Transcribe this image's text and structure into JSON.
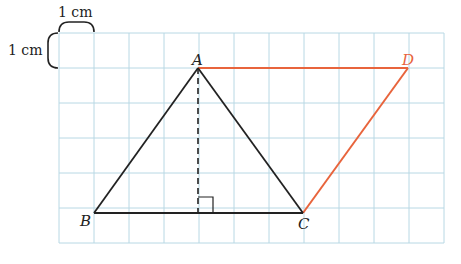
{
  "diagram": {
    "type": "geometry-grid",
    "grid": {
      "cols": 11,
      "rows": 6,
      "origin_x": 59,
      "origin_y": 33,
      "cell_px": 35,
      "color": "#b8d8e4"
    },
    "scale": {
      "horizontal_label": "1 cm",
      "vertical_label": "1 cm"
    },
    "points": {
      "A": {
        "label": "A",
        "grid": [
          4,
          1
        ]
      },
      "B": {
        "label": "B",
        "grid": [
          1,
          5
        ]
      },
      "C": {
        "label": "C",
        "grid": [
          7,
          5
        ]
      },
      "D": {
        "label": "D",
        "grid": [
          10,
          1
        ]
      }
    },
    "segments": [
      {
        "from": "A",
        "to": "B",
        "color": "#222222",
        "style": "solid"
      },
      {
        "from": "B",
        "to": "C",
        "color": "#222222",
        "style": "solid"
      },
      {
        "from": "A",
        "to": "C",
        "color": "#222222",
        "style": "solid"
      },
      {
        "from": "A",
        "to": "D",
        "color": "#e8643c",
        "style": "solid"
      },
      {
        "from": "D",
        "to": "C",
        "color": "#e8643c",
        "style": "solid"
      },
      {
        "from": "A",
        "to": "foot",
        "color": "#222222",
        "style": "dashed"
      }
    ],
    "height_foot": {
      "grid": [
        4,
        5
      ],
      "right_angle_marker": true
    },
    "colors": {
      "triangle": "#222222",
      "extension": "#e8643c",
      "grid": "#b8d8e4"
    }
  }
}
